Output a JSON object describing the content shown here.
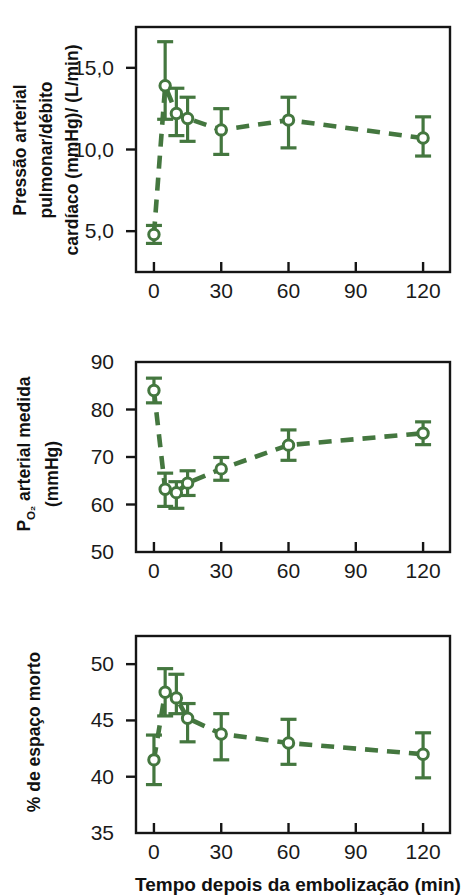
{
  "figure": {
    "background_color": "#ffffff",
    "series_color": "#44773f",
    "axis_color": "#151515",
    "text_color": "#1a1a1a",
    "xaxis_caption": "Tempo depois da embolização (min)"
  },
  "chart_data": [
    {
      "type": "line",
      "panel_index": 0,
      "title": "",
      "ylabel": "Pressão arterial pulmonar/débito cardíaco (mmHg)/ (L/min)",
      "ylabel_lines": [
        "Pressão arterial",
        "pulmonar/débito",
        "cardíaco (mmHg)/ (L/min)"
      ],
      "xlabel": "",
      "xlim": [
        -8,
        132
      ],
      "ylim": [
        2.5,
        17.5
      ],
      "xticks": [
        0,
        30,
        60,
        90,
        120
      ],
      "xticklabels": [
        "0",
        "30",
        "60",
        "90",
        "120"
      ],
      "yticks": [
        5.0,
        10.0,
        15.0
      ],
      "yticklabels": [
        "5,0",
        "10,0",
        "15,0"
      ],
      "grid": false,
      "legend": "none",
      "linestyle": "dashed",
      "marker": "open-circle",
      "x": [
        0,
        5,
        10,
        15,
        30,
        60,
        120
      ],
      "values": [
        4.8,
        13.9,
        12.2,
        11.9,
        11.2,
        11.8,
        10.7
      ],
      "error_upper": [
        0.55,
        2.7,
        1.55,
        1.3,
        1.3,
        1.4,
        1.3
      ],
      "error_lower": [
        0.55,
        2.05,
        1.35,
        1.4,
        1.5,
        1.7,
        1.1
      ]
    },
    {
      "type": "line",
      "panel_index": 1,
      "title": "",
      "ylabel": "PO2 arterial medida (mmHg)",
      "ylabel_main": "arterial medida",
      "ylabel_symbol": "P",
      "ylabel_subscript": "O2",
      "ylabel_units": "(mmHg)",
      "xlabel": "",
      "xlim": [
        -8,
        132
      ],
      "ylim": [
        50,
        90
      ],
      "xticks": [
        0,
        30,
        60,
        90,
        120
      ],
      "xticklabels": [
        "0",
        "30",
        "60",
        "90",
        "120"
      ],
      "yticks": [
        50,
        60,
        70,
        80,
        90
      ],
      "yticklabels": [
        "50",
        "60",
        "70",
        "80",
        "90"
      ],
      "grid": false,
      "legend": "none",
      "linestyle": "dashed",
      "marker": "open-circle",
      "x": [
        0,
        5,
        10,
        15,
        30,
        60,
        120
      ],
      "values": [
        84.0,
        63.2,
        62.5,
        64.5,
        67.5,
        72.5,
        75.0
      ],
      "error_upper": [
        2.6,
        3.4,
        2.3,
        2.6,
        2.4,
        3.2,
        2.4
      ],
      "error_lower": [
        2.6,
        3.6,
        3.3,
        2.6,
        2.4,
        3.2,
        2.4
      ]
    },
    {
      "type": "line",
      "panel_index": 2,
      "title": "",
      "ylabel": "% de espaço morto",
      "xlabel": "Tempo depois da embolização (min)",
      "xlim": [
        -8,
        132
      ],
      "ylim": [
        35,
        52.5
      ],
      "xticks": [
        0,
        30,
        60,
        90,
        120
      ],
      "xticklabels": [
        "0",
        "30",
        "60",
        "90",
        "120"
      ],
      "yticks": [
        35,
        40,
        45,
        50
      ],
      "yticklabels": [
        "35",
        "40",
        "45",
        "50"
      ],
      "grid": false,
      "legend": "none",
      "linestyle": "dashed",
      "marker": "open-circle",
      "x": [
        0,
        5,
        10,
        15,
        30,
        60,
        120
      ],
      "values": [
        41.5,
        47.5,
        47.0,
        45.2,
        43.8,
        43.0,
        42.0
      ],
      "error_upper": [
        2.2,
        2.1,
        2.1,
        1.3,
        1.8,
        2.1,
        1.9
      ],
      "error_lower": [
        2.2,
        2.1,
        1.4,
        2.1,
        2.3,
        1.9,
        2.1
      ]
    }
  ]
}
